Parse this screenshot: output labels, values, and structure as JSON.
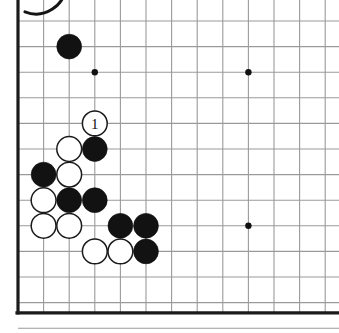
{
  "figure": {
    "kind": "go-board-diagram",
    "title": "",
    "background_color": "#ffffff"
  },
  "corner_mark": {
    "name": "cut-off-circle-arc",
    "visible": true,
    "center_x": 36,
    "center_y": -16,
    "radius": 30,
    "color": "#151515"
  },
  "board": {
    "origin_x": 18,
    "origin_y": 21,
    "spacing": 25.6,
    "columns_visible": 12,
    "rows_visible": 12,
    "edge_color": "#1b1b1b",
    "grid_color": "#9a9a9a",
    "edges": {
      "left": true,
      "top": false,
      "bottom": true,
      "right": false
    },
    "clipped_right": true,
    "clipped_top": true,
    "star_points": [
      {
        "name": "star-point-upper-left",
        "col": 3,
        "row": 2
      },
      {
        "name": "star-point-upper-right",
        "col": 9,
        "row": 2
      },
      {
        "name": "star-point-lower-right",
        "col": 9,
        "row": 8
      }
    ],
    "star_point_radius": 3.2,
    "stone_radius": 12.4
  },
  "stones": [
    {
      "id": "b1",
      "color": "black",
      "col": 2,
      "row": 1,
      "label": ""
    },
    {
      "id": "w1",
      "color": "white",
      "col": 3,
      "row": 4,
      "label": "1"
    },
    {
      "id": "b2",
      "color": "black",
      "col": 3,
      "row": 5,
      "label": ""
    },
    {
      "id": "w2",
      "color": "white",
      "col": 2,
      "row": 5,
      "label": ""
    },
    {
      "id": "b3",
      "color": "black",
      "col": 1,
      "row": 6,
      "label": ""
    },
    {
      "id": "w3",
      "color": "white",
      "col": 2,
      "row": 6,
      "label": ""
    },
    {
      "id": "w4",
      "color": "white",
      "col": 1,
      "row": 7,
      "label": ""
    },
    {
      "id": "b4",
      "color": "black",
      "col": 2,
      "row": 7,
      "label": ""
    },
    {
      "id": "b5",
      "color": "black",
      "col": 3,
      "row": 7,
      "label": ""
    },
    {
      "id": "w5",
      "color": "white",
      "col": 1,
      "row": 8,
      "label": ""
    },
    {
      "id": "w6",
      "color": "white",
      "col": 2,
      "row": 8,
      "label": ""
    },
    {
      "id": "b6",
      "color": "black",
      "col": 4,
      "row": 8,
      "label": ""
    },
    {
      "id": "b7",
      "color": "black",
      "col": 5,
      "row": 8,
      "label": ""
    },
    {
      "id": "w7",
      "color": "white",
      "col": 3,
      "row": 9,
      "label": ""
    },
    {
      "id": "w8",
      "color": "white",
      "col": 4,
      "row": 9,
      "label": ""
    },
    {
      "id": "b8",
      "color": "black",
      "col": 5,
      "row": 9,
      "label": ""
    }
  ],
  "move_labels": [
    {
      "text": "1",
      "on_stone": "w1",
      "text_color": "#111111"
    }
  ]
}
